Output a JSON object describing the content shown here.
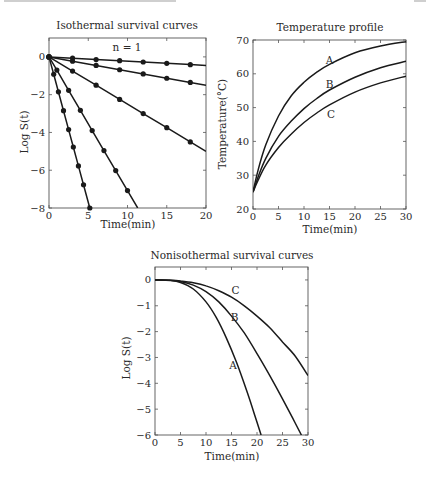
{
  "figure": {
    "background": "#ffffff",
    "ink_color": "#1a1a1a"
  },
  "chart_data": [
    {
      "id": "isothermal",
      "type": "line",
      "title": "Isothermal survival curves",
      "annotation": "n = 1",
      "xlabel": "Time(min)",
      "ylabel": "Log S(t)",
      "xlim": [
        0,
        20
      ],
      "ylim": [
        -8,
        1
      ],
      "xticks": [
        0,
        5,
        10,
        15,
        20
      ],
      "yticks": [
        0,
        -2,
        -4,
        -6,
        -8
      ],
      "ytick_labels": [
        "0",
        "−2",
        "−4",
        "−6",
        "−8"
      ],
      "markers": true,
      "grid": false,
      "series": [
        {
          "name": "line1",
          "x": [
            0,
            3,
            6,
            9,
            12,
            15,
            18,
            20
          ],
          "y": [
            0,
            -0.07,
            -0.14,
            -0.2,
            -0.27,
            -0.34,
            -0.41,
            -0.45
          ],
          "points_x": [
            0,
            3,
            6,
            9,
            12,
            15,
            18
          ]
        },
        {
          "name": "line2",
          "x": [
            0,
            3,
            6,
            9,
            12,
            15,
            18,
            20
          ],
          "y": [
            0,
            -0.23,
            -0.45,
            -0.68,
            -0.9,
            -1.13,
            -1.35,
            -1.5
          ],
          "points_x": [
            0,
            3,
            6,
            9,
            12,
            15,
            18
          ]
        },
        {
          "name": "line3",
          "x": [
            0,
            3,
            6,
            9,
            12,
            15,
            18,
            20
          ],
          "y": [
            0,
            -0.75,
            -1.5,
            -2.25,
            -3.0,
            -3.75,
            -4.5,
            -5.0
          ],
          "points_x": [
            0,
            3,
            6,
            9,
            12,
            15,
            18
          ]
        },
        {
          "name": "line4",
          "x": [
            0,
            1.0,
            2.5,
            4.0,
            5.5,
            7.0,
            8.5,
            10.0,
            11.3
          ],
          "y": [
            0,
            -0.7,
            -1.77,
            -2.83,
            -3.9,
            -4.96,
            -6.02,
            -7.08,
            -8.0
          ],
          "points_x": [
            0,
            1.0,
            2.5,
            4.0,
            5.5,
            7.0,
            8.5,
            10.0
          ]
        },
        {
          "name": "line5",
          "x": [
            0,
            0.6,
            1.2,
            1.85,
            2.5,
            3.1,
            3.75,
            4.4,
            5.2
          ],
          "y": [
            0,
            -0.92,
            -1.85,
            -2.85,
            -3.85,
            -4.77,
            -5.77,
            -6.77,
            -8.0
          ],
          "points_x": [
            0,
            0.6,
            1.2,
            1.85,
            2.5,
            3.1,
            3.75,
            4.4,
            5.2
          ]
        }
      ]
    },
    {
      "id": "temperature",
      "type": "line",
      "title": "Temperature profile",
      "xlabel": "Time(min)",
      "ylabel": "Temperature(°C)",
      "xlim": [
        0,
        30
      ],
      "ylim": [
        20,
        70
      ],
      "xticks": [
        0,
        5,
        10,
        15,
        20,
        25,
        30
      ],
      "yticks": [
        20,
        30,
        40,
        50,
        60,
        70
      ],
      "grid": false,
      "series": [
        {
          "name": "A",
          "x": [
            0,
            1,
            2.5,
            5,
            7.5,
            10,
            12.5,
            15,
            20,
            25,
            30
          ],
          "y": [
            25,
            31.5,
            39,
            47.5,
            53.5,
            57.5,
            60.5,
            62.8,
            66.2,
            68.2,
            69.5
          ],
          "label_at": [
            15,
            64.2
          ]
        },
        {
          "name": "B",
          "x": [
            0,
            1,
            2.5,
            5,
            7.5,
            10,
            12.5,
            15,
            20,
            25,
            30
          ],
          "y": [
            25,
            29.5,
            35,
            41.5,
            46,
            49.7,
            52.7,
            55.2,
            59,
            61.8,
            63.7
          ],
          "label_at": [
            15,
            57
          ]
        },
        {
          "name": "C",
          "x": [
            0,
            1,
            2.5,
            5,
            7.5,
            10,
            12.5,
            15,
            20,
            25,
            30
          ],
          "y": [
            25,
            28.5,
            33,
            38.2,
            42.2,
            45.6,
            48.4,
            50.8,
            54.6,
            57.3,
            59.3
          ],
          "label_at": [
            15.3,
            48.2
          ]
        }
      ]
    },
    {
      "id": "nonisothermal",
      "type": "line",
      "title": "Nonisothermal survival curves",
      "xlabel": "Time(min)",
      "ylabel": "Log S(t)",
      "xlim": [
        0,
        30
      ],
      "ylim": [
        -6,
        0.5
      ],
      "xticks": [
        0,
        5,
        10,
        15,
        20,
        25,
        30
      ],
      "yticks": [
        0,
        -1,
        -2,
        -3,
        -4,
        -5,
        -6
      ],
      "ytick_labels": [
        "0",
        "−1",
        "−2",
        "−3",
        "−4",
        "−5",
        "−6"
      ],
      "grid": false,
      "series": [
        {
          "name": "A",
          "x": [
            0,
            3,
            5,
            7.5,
            10,
            12,
            14,
            16,
            18,
            19.5,
            20.8
          ],
          "y": [
            0,
            -0.02,
            -0.1,
            -0.35,
            -0.85,
            -1.45,
            -2.25,
            -3.2,
            -4.3,
            -5.2,
            -6.0
          ],
          "label_at": [
            15.3,
            -3.3
          ]
        },
        {
          "name": "B",
          "x": [
            0,
            3,
            5,
            7.5,
            10,
            12.5,
            15,
            17.5,
            20,
            22.5,
            25,
            27,
            28.7
          ],
          "y": [
            0,
            -0.01,
            -0.06,
            -0.2,
            -0.45,
            -0.85,
            -1.4,
            -2.05,
            -2.85,
            -3.7,
            -4.6,
            -5.35,
            -6.0
          ],
          "label_at": [
            15.6,
            -1.45
          ]
        },
        {
          "name": "C",
          "x": [
            0,
            3,
            5,
            7.5,
            10,
            12.5,
            15,
            17.5,
            20,
            22.5,
            25,
            27.5,
            30
          ],
          "y": [
            0,
            -0.01,
            -0.04,
            -0.11,
            -0.23,
            -0.42,
            -0.67,
            -1.0,
            -1.4,
            -1.85,
            -2.4,
            -2.95,
            -3.7
          ],
          "label_at": [
            15.8,
            -0.4
          ]
        }
      ]
    }
  ]
}
